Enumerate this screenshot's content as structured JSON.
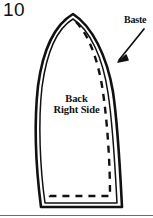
{
  "figure": {
    "number": "10",
    "piece_label_line1": "Back",
    "piece_label_line2": "Right Side",
    "annotation_label": "Baste"
  },
  "colors": {
    "ink": "#111111",
    "paper": "#ffffff",
    "rule": "#6d6d6d"
  },
  "geometry": {
    "outer_outline": "M 73,14 C 56,24 43,48 38,86 C 34,122 36,168 41,207 L 122,207 C 120,168 118,126 113,92 C 107,56 92,26 73,14 Z",
    "inner_outline": "M 73,19 C 58,28 47,50 42,87 C 38,122 40,168 45,203 L 117,203 C 115,166 113,125 108,93 C 103,58 90,30 73,19 Z",
    "seam_dashes": "M 76,22 C 88,34 98,58 103,92 C 108,128 110,166 110,196 L 50,196 L 50,190",
    "arrow_line": "M 144,29 L 119,60",
    "arrow_head": "118,62 126,55 128,60",
    "bottom_rule_y": 215
  }
}
